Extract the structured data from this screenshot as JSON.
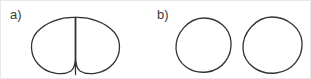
{
  "figure": {
    "canvas": {
      "width": 311,
      "height": 79,
      "background": "#ffffff",
      "border_color": "#e8e8e8"
    },
    "stroke": {
      "color": "#333333",
      "width": 1.3,
      "fill": "none"
    },
    "panels": [
      {
        "id": "panel-a",
        "label": "a)",
        "label_x": 9,
        "label_y": 7,
        "description": "two rounded cells pressed together sharing a straight vertical contact boundary",
        "shapes": [
          {
            "name": "left-cell",
            "path": "M 74.5 16.5 C 60 16 45 21 36 31 C 28 40 29 54 37 63 C 46 73 62 75 70 70 C 73.5 67.5 74.5 62 74.5 55 Z"
          },
          {
            "name": "right-cell",
            "path": "M 74.5 16.5 C 89 16 104 21 113 31 C 121 40 120 54 112 63 C 103 73 87 75 79 70 C 75.5 67.5 74.5 62 74.5 55 Z"
          },
          {
            "name": "contact-boundary",
            "path": "M 74.5 16.5 L 74.5 73.5"
          }
        ]
      },
      {
        "id": "panel-b",
        "label": "b)",
        "label_x": 156,
        "label_y": 7,
        "description": "two separated rounded cells with a gap between them",
        "shapes": [
          {
            "name": "left-cell",
            "path": "M 203 17 C 217 17 229 27 230 41 C 231 55 222 69 206 71 C 189 73 176 62 175 48 C 174 33 187 17 203 17 Z"
          },
          {
            "name": "right-cell",
            "path": "M 271 16 C 286 16 300 27 301 41 C 302 56 292 70 275 72 C 258 74 243 63 242 48 C 241 32 255 16 271 16 Z"
          }
        ]
      }
    ]
  }
}
